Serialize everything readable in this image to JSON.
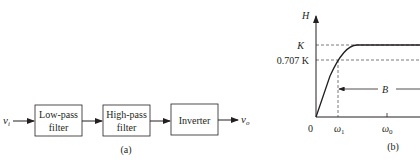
{
  "part_a": {
    "caption": "(a)",
    "input": {
      "symbol": "v",
      "subscript": "i"
    },
    "output": {
      "symbol": "v",
      "subscript": "o"
    },
    "blocks": [
      {
        "line1": "Low-pass",
        "line2": "filter"
      },
      {
        "line1": "High-pass",
        "line2": "filter"
      },
      {
        "line1": "Inverter",
        "line2": ""
      }
    ]
  },
  "part_b": {
    "caption": "(b)",
    "y_axis_label": "H",
    "y_ticks": [
      "K",
      "0.707 K"
    ],
    "x_ticks": [
      "0",
      "ω",
      "ω"
    ],
    "x_tick_subscripts": [
      "",
      "1",
      "0"
    ],
    "bandwidth_label": "B"
  },
  "colors": {
    "ink": "#231f20",
    "background": "#ffffff"
  }
}
